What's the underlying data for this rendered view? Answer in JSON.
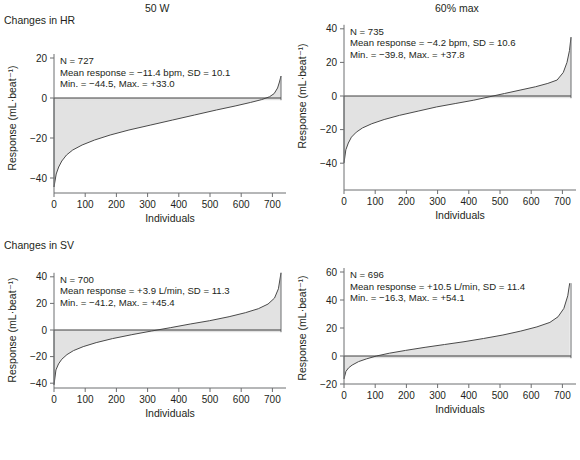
{
  "figure": {
    "column_titles": [
      "50 W",
      "60% max"
    ],
    "row_titles": [
      "Changes in HR",
      "Changes in SV"
    ],
    "axis_labels": {
      "x": "Individuals",
      "y": "Response (mL·beat⁻¹)"
    },
    "fill_color": "#e2e2e2",
    "line_color": "#4a4a4a",
    "axis_color": "#6d6e70",
    "caption": ""
  },
  "chart_data": [
    {
      "type": "area",
      "panel": "top-left",
      "title": "50 W",
      "row_label": "Changes in HR",
      "xlabel": "Individuals",
      "ylabel": "Response (mL·beat⁻¹)",
      "xlim": [
        0,
        727
      ],
      "ylim": [
        -48,
        33
      ],
      "xticks": [
        0,
        100,
        200,
        300,
        400,
        500,
        600,
        700
      ],
      "yticks": [
        20,
        0,
        -20,
        -40
      ],
      "grid": false,
      "legend": "none",
      "n": 727,
      "mean_response": -11.4,
      "mean_units": "bpm",
      "sd": 10.1,
      "min": -44.5,
      "max": 33.0,
      "annotations": [
        "N = 727",
        "Mean response = −11.4 bpm, SD = 10.1",
        "Min. = −44.5, Max. = +33.0"
      ],
      "x": [
        0,
        7,
        15,
        25,
        40,
        60,
        90,
        130,
        180,
        240,
        310,
        380,
        450,
        520,
        580,
        630,
        665,
        690,
        705,
        716,
        722,
        727
      ],
      "y": [
        -44.5,
        -38.0,
        -34.5,
        -31.5,
        -28.5,
        -26.0,
        -23.5,
        -21.0,
        -18.5,
        -16.0,
        -13.5,
        -11.0,
        -8.5,
        -6.0,
        -4.0,
        -2.2,
        -0.8,
        0.6,
        2.2,
        5.0,
        8.0,
        11.0
      ]
    },
    {
      "type": "area",
      "panel": "top-right",
      "title": "60% max",
      "row_label": "Changes in HR",
      "xlabel": "Individuals",
      "ylabel": "Response (mL·beat⁻¹)",
      "xlim": [
        0,
        735
      ],
      "ylim": [
        -44,
        40
      ],
      "xticks": [
        0,
        100,
        200,
        300,
        400,
        500,
        600,
        700
      ],
      "yticks": [
        40,
        20,
        0,
        -20,
        -40
      ],
      "grid": false,
      "legend": "none",
      "n": 735,
      "mean_response": -4.2,
      "mean_units": "bpm",
      "sd": 10.6,
      "min": -39.8,
      "max": 37.8,
      "annotations": [
        "N = 735",
        "Mean response = −4.2 bpm, SD = 10.6",
        "Min. = −39.8, Max. = +37.8"
      ],
      "x": [
        0,
        6,
        14,
        24,
        40,
        60,
        90,
        130,
        180,
        240,
        300,
        360,
        420,
        470,
        520,
        570,
        620,
        660,
        690,
        710,
        722,
        730,
        735
      ],
      "y": [
        -39.8,
        -32.0,
        -28.0,
        -24.5,
        -21.5,
        -19.0,
        -16.5,
        -14.0,
        -11.5,
        -9.0,
        -6.5,
        -4.5,
        -2.5,
        -0.5,
        1.5,
        3.5,
        5.5,
        7.5,
        9.5,
        14.0,
        20.0,
        27.0,
        35.0
      ]
    },
    {
      "type": "area",
      "panel": "bottom-left",
      "title": "50 W",
      "row_label": "Changes in SV",
      "xlabel": "Individuals",
      "ylabel": "Response (mL·beat⁻¹)",
      "xlim": [
        0,
        700
      ],
      "ylim": [
        -48,
        45
      ],
      "xticks": [
        0,
        100,
        200,
        300,
        400,
        500,
        600,
        700
      ],
      "yticks": [
        40,
        20,
        0,
        -20,
        -40
      ],
      "grid": false,
      "legend": "none",
      "n": 700,
      "mean_response": 3.9,
      "mean_units": "L/min",
      "sd": 11.3,
      "min": -41.2,
      "max": 45.4,
      "annotations": [
        "N = 700",
        "Mean response = +3.9 L/min, SD = 11.3",
        "Min. = −41.2, Max. = +45.4"
      ],
      "x": [
        0,
        6,
        14,
        24,
        40,
        60,
        90,
        130,
        180,
        240,
        300,
        360,
        420,
        480,
        540,
        590,
        630,
        660,
        680,
        692,
        700
      ],
      "y": [
        -41.2,
        -30.0,
        -25.5,
        -22.0,
        -18.5,
        -15.5,
        -12.5,
        -9.5,
        -6.5,
        -3.5,
        -0.8,
        1.8,
        4.5,
        7.0,
        10.0,
        13.0,
        16.0,
        19.5,
        24.0,
        31.0,
        43.0
      ]
    },
    {
      "type": "area",
      "panel": "bottom-right",
      "title": "60% max",
      "row_label": "Changes in SV",
      "xlabel": "Individuals",
      "ylabel": "Response (mL·beat⁻¹)",
      "xlim": [
        0,
        700
      ],
      "ylim": [
        -20,
        60
      ],
      "xticks": [
        0,
        100,
        200,
        300,
        400,
        500,
        600,
        700
      ],
      "yticks": [
        60,
        40,
        20,
        0,
        -20
      ],
      "grid": false,
      "legend": "none",
      "n": 696,
      "mean_response": 10.5,
      "mean_units": "L/min",
      "sd": 11.4,
      "min": -16.3,
      "max": 54.1,
      "annotations": [
        "N = 696",
        "Mean response = +10.5 L/min, SD = 11.4",
        "Min. = −16.3, Max. = +54.1"
      ],
      "x": [
        0,
        6,
        14,
        25,
        45,
        70,
        100,
        140,
        190,
        250,
        310,
        370,
        430,
        490,
        545,
        595,
        635,
        660,
        678,
        690,
        696
      ],
      "y": [
        -16.3,
        -11.0,
        -8.5,
        -6.5,
        -4.0,
        -2.0,
        0.0,
        2.0,
        4.0,
        6.2,
        8.2,
        10.2,
        12.5,
        15.0,
        17.8,
        20.8,
        24.0,
        28.0,
        34.0,
        43.0,
        52.0
      ]
    }
  ],
  "panel_geometry": [
    {
      "left": 0,
      "top": 0,
      "plot_x0": 54,
      "plot_x1": 281,
      "y_zero": 98,
      "px_per_unit": 2.0,
      "baseline_y": 193,
      "axis_y": 193
    },
    {
      "left": 290,
      "top": 0,
      "plot_x0": 54,
      "plot_x1": 281,
      "y_zero": 96,
      "px_per_unit": 1.68,
      "baseline_y": 190,
      "axis_y": 190
    },
    {
      "left": 0,
      "top": 225,
      "plot_x0": 54,
      "plot_x1": 281,
      "y_zero": 105,
      "px_per_unit": 1.33,
      "baseline_y": 163,
      "axis_y": 163
    },
    {
      "left": 290,
      "top": 225,
      "plot_x0": 54,
      "plot_x1": 281,
      "y_zero": 131,
      "px_per_unit": 1.4,
      "baseline_y": 159,
      "axis_y": 159
    }
  ]
}
